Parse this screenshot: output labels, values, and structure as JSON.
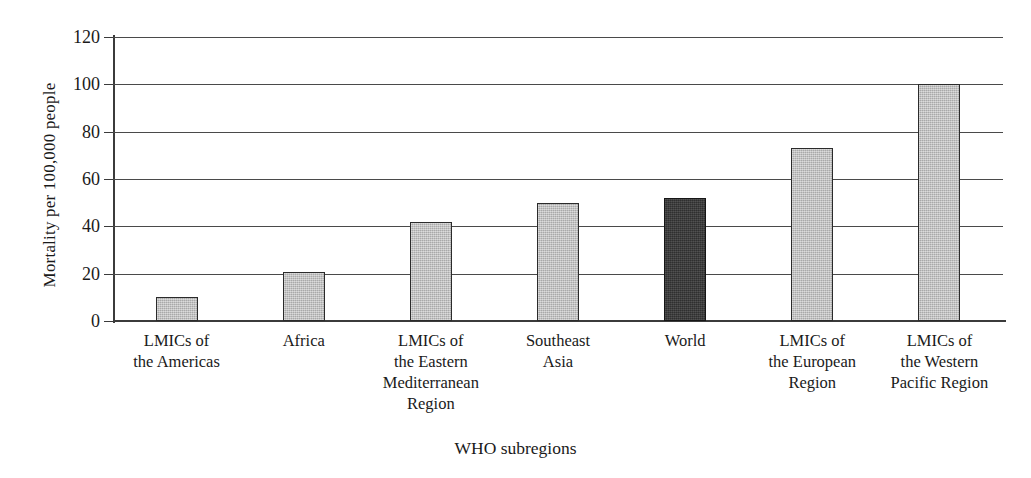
{
  "chart_data": {
    "type": "bar",
    "title": "",
    "xlabel": "WHO subregions",
    "ylabel": "Mortality per 100,000 people",
    "ylim": [
      0,
      120
    ],
    "yticks": [
      0,
      20,
      40,
      60,
      80,
      100,
      120
    ],
    "ytick_labels": [
      "0",
      "20",
      "40",
      "60",
      "80",
      "100",
      "120"
    ],
    "grid": true,
    "legend": "none",
    "categories": [
      "LMICs of\nthe Americas",
      "Africa",
      "LMICs of\nthe Eastern\nMediterranean\nRegion",
      "Southeast\nAsia",
      "World",
      "LMICs of\nthe European\nRegion",
      "LMICs of\nthe Western\nPacific Region"
    ],
    "values": [
      10,
      20.5,
      42,
      50,
      52,
      73,
      100
    ],
    "bar_colors": [
      "#bdbdbd",
      "#bdbdbd",
      "#bdbdbd",
      "#bdbdbd",
      "#3a3a3a",
      "#bdbdbd",
      "#bdbdbd"
    ],
    "highlight_index": 4,
    "colors": {
      "bar_fill": "#bdbdbd",
      "bar_highlight_fill": "#3a3a3a",
      "bar_edge": "#2b2b2b",
      "axis": "#3b3b3b",
      "gridline": "#4a4a4a",
      "text": "#1a1a1a",
      "background": "#ffffff"
    }
  }
}
